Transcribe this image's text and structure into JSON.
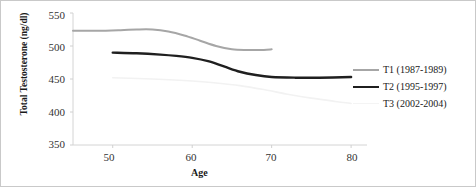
{
  "chart_data": {
    "type": "line",
    "title": "",
    "xlabel": "Age",
    "ylabel": "Total Testosterone (ng/dl)",
    "xlim": [
      45,
      82
    ],
    "ylim": [
      350,
      550
    ],
    "xticks": [
      50,
      60,
      70,
      80
    ],
    "yticks": [
      350,
      400,
      450,
      500,
      550
    ],
    "grid": false,
    "legend_position": "right",
    "series": [
      {
        "name": "T1 (1987-1989)",
        "color": "#a6a6a6",
        "width": 2.0,
        "x": [
          45,
          48,
          51,
          53,
          55,
          57,
          59,
          61,
          63,
          65,
          67,
          69,
          70
        ],
        "values": [
          523,
          523,
          524,
          525,
          525,
          522,
          516,
          508,
          500,
          495,
          494,
          494,
          495
        ]
      },
      {
        "name": "T2 (1995-1997)",
        "color": "#1f1f1f",
        "width": 2.4,
        "x": [
          50,
          53,
          56,
          58,
          60,
          62,
          64,
          66,
          68,
          70,
          73,
          76,
          80
        ],
        "values": [
          490,
          489,
          487,
          485,
          482,
          477,
          469,
          461,
          456,
          453,
          452,
          452,
          453
        ]
      },
      {
        "name": "T3 (2002-2004)",
        "color": "#f2f2f2",
        "width": 1.6,
        "x": [
          50,
          55,
          60,
          63,
          66,
          69,
          72,
          75,
          78,
          80
        ],
        "values": [
          452,
          450,
          447,
          444,
          440,
          434,
          427,
          421,
          416,
          413
        ]
      }
    ]
  },
  "axis": {
    "yticks": [
      "550",
      "500",
      "450",
      "400",
      "350"
    ],
    "xticks": [
      "50",
      "60",
      "70",
      "80"
    ],
    "ylabel": "Total Testosterone (ng/dl)",
    "xlabel": "Age"
  },
  "legend": {
    "items": [
      {
        "label": "T1 (1987-1989)",
        "color": "#a6a6a6"
      },
      {
        "label": "T2 (1995-1997)",
        "color": "#1f1f1f"
      },
      {
        "label": "T3 (2002-2004)",
        "color": "#f4f4f4"
      }
    ]
  },
  "colors": {
    "axis": "#d0d0d0",
    "tick_text": "#333333",
    "label_text": "#1a1a1a",
    "border": "#c9c9c9"
  }
}
